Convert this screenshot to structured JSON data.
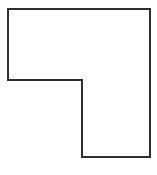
{
  "figure": {
    "shape_name": "l-shape-polygon",
    "background_color": "#ffffff",
    "stroke_color": "#2e2e2e",
    "fill_color": "#ffffff",
    "stroke_width": 2,
    "canvas": {
      "width": 157,
      "height": 175
    },
    "vertices": [
      {
        "label": "top-left",
        "x": 8,
        "y": 9
      },
      {
        "label": "top-right",
        "x": 150,
        "y": 9
      },
      {
        "label": "bottom-right",
        "x": 150,
        "y": 157
      },
      {
        "label": "leg-bottom-left",
        "x": 82,
        "y": 157
      },
      {
        "label": "inner-notch-corner",
        "x": 82,
        "y": 80
      },
      {
        "label": "left-lower",
        "x": 8,
        "y": 80
      }
    ],
    "points_string": "8,9 150,9 150,157 82,157 82,80 8,80",
    "edges": [
      {
        "name": "top-edge",
        "from": "top-left",
        "to": "top-right"
      },
      {
        "name": "right-edge",
        "from": "top-right",
        "to": "bottom-right"
      },
      {
        "name": "bottom-edge",
        "from": "bottom-right",
        "to": "leg-bottom-left"
      },
      {
        "name": "leg-left-edge",
        "from": "leg-bottom-left",
        "to": "inner-notch-corner"
      },
      {
        "name": "notch-horizontal-edge",
        "from": "inner-notch-corner",
        "to": "left-lower"
      },
      {
        "name": "left-edge",
        "from": "left-lower",
        "to": "top-left"
      }
    ]
  }
}
